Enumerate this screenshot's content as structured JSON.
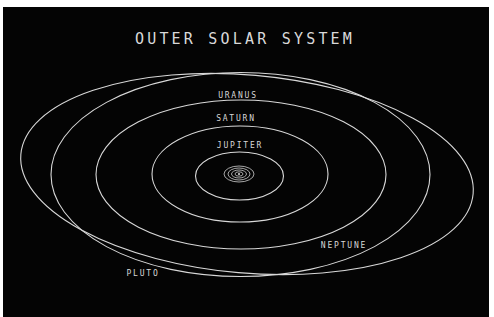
{
  "diagram": {
    "title": "OUTER SOLAR SYSTEM",
    "colors": {
      "background": "#040404",
      "border": "#ffffff",
      "line": "#d8d8d8",
      "text": "#d6d6d6"
    },
    "orbits": [
      {
        "name": "Inner planets",
        "label": ""
      },
      {
        "name": "Jupiter",
        "label": "JUPITER"
      },
      {
        "name": "Saturn",
        "label": "SATURN"
      },
      {
        "name": "Uranus",
        "label": "URANUS"
      },
      {
        "name": "Neptune",
        "label": "NEPTUNE"
      },
      {
        "name": "Pluto",
        "label": "PLUTO"
      }
    ],
    "labels": {
      "jupiter": "JUPITER",
      "saturn": "SATURN",
      "uranus": "URANUS",
      "neptune": "NEPTUNE",
      "pluto": "PLUTO"
    }
  }
}
